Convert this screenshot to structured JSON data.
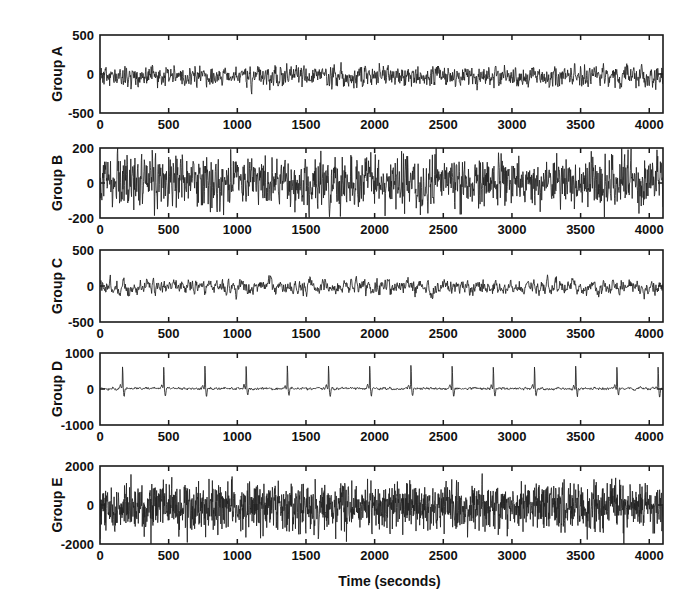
{
  "chart_data": {
    "type": "line",
    "title": "",
    "subtitle": "",
    "xlabel": "Time (seconds)",
    "ylabel": "",
    "grid": false,
    "legend": false,
    "legend_position": "none",
    "layout": "5 stacked panels sharing the x axis",
    "xlim": [
      0,
      4100
    ],
    "xticks": [
      0,
      500,
      1000,
      1500,
      2000,
      2500,
      3000,
      3500,
      4000
    ],
    "xtick_labels": [
      "0",
      "500",
      "1000",
      "1500",
      "2000",
      "2500",
      "3000",
      "3500",
      "4000"
    ],
    "line_color": "#222222",
    "panels": [
      {
        "name": "Group A",
        "ylabel": "Group A",
        "ylim": [
          -500,
          500
        ],
        "yticks": [
          -500,
          0,
          500
        ],
        "ytick_labels": [
          "-500",
          "0",
          "500"
        ],
        "description": "dense low-amplitude noise centred slightly below zero",
        "noise_amplitude": 95,
        "baseline": -30,
        "spike_scale": 0.0,
        "seed": 11,
        "density": 1400,
        "smooth": 0.35
      },
      {
        "name": "Group B",
        "ylabel": "Group B",
        "ylim": [
          -200,
          200
        ],
        "yticks": [
          -200,
          0,
          200
        ],
        "ytick_labels": [
          "-200",
          "0",
          "200"
        ],
        "description": "broad band noise filling most of the vertical range",
        "noise_amplitude": 88,
        "baseline": 5,
        "spike_scale": 0.0,
        "seed": 27,
        "density": 1500,
        "smooth": 0.2
      },
      {
        "name": "Group C",
        "ylabel": "Group C",
        "ylim": [
          -500,
          500
        ],
        "yticks": [
          -500,
          0,
          500
        ],
        "ytick_labels": [
          "-500",
          "0",
          "500"
        ],
        "description": "moderate amplitude wandering noise near zero",
        "noise_amplitude": 105,
        "baseline": -10,
        "spike_scale": 0.0,
        "seed": 43,
        "density": 1200,
        "smooth": 0.55
      },
      {
        "name": "Group D",
        "ylabel": "Group D",
        "ylim": [
          -1000,
          1000
        ],
        "yticks": [
          -1000,
          0,
          1000
        ],
        "ytick_labels": [
          "-1000",
          "0",
          "1000"
        ],
        "description": "quasi-periodic ECG-like beats with tall narrow spikes about every 300 seconds",
        "noise_amplitude": 38,
        "baseline": 10,
        "spike_scale": 700,
        "spike_period": 300,
        "seed": 59,
        "density": 1600,
        "smooth": 0.6
      },
      {
        "name": "Group E",
        "ylabel": "Group E",
        "ylim": [
          -2000,
          2000
        ],
        "yticks": [
          -2000,
          0,
          2000
        ],
        "ytick_labels": [
          "-2000",
          "0",
          "2000"
        ],
        "description": "very dense high amplitude noise with downward excursions",
        "noise_amplitude": 620,
        "baseline": -60,
        "spike_scale": 0.0,
        "seed": 71,
        "density": 2000,
        "smooth": 0.05
      }
    ]
  }
}
